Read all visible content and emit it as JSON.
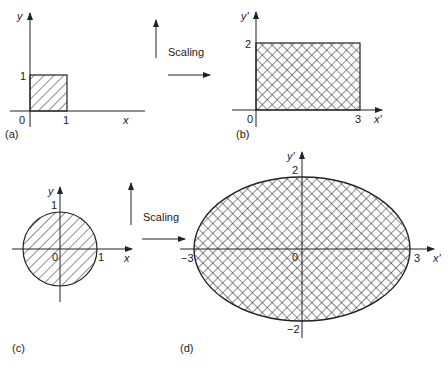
{
  "panels": {
    "a": {
      "caption": "(a)",
      "x_label": "x",
      "y_label": "y",
      "origin": "0",
      "x_tick": "1",
      "y_tick": "1",
      "shape": "unit square, single hatch"
    },
    "b": {
      "caption": "(b)",
      "x_label": "x'",
      "y_label": "y'",
      "origin": "0",
      "x_tick": "3",
      "y_tick": "2",
      "shape": "3x2 rectangle, cross hatch"
    },
    "c": {
      "caption": "(c)",
      "x_label": "x",
      "y_label": "y",
      "origin": "0",
      "x_tick": "1",
      "y_tick": "1",
      "shape": "unit circle, single hatch"
    },
    "d": {
      "caption": "(d)",
      "x_label": "x'",
      "y_label": "y'",
      "origin": "0",
      "x_tick_pos": "3",
      "x_tick_neg": "−3",
      "y_tick_pos": "2",
      "y_tick_neg": "−2",
      "shape": "ellipse semi-axes 3 and 2, cross hatch"
    }
  },
  "transforms": {
    "top": {
      "label": "Scaling"
    },
    "bottom": {
      "label": "Scaling"
    }
  },
  "colors": {
    "ink": "#222222",
    "background": "#ffffff"
  }
}
